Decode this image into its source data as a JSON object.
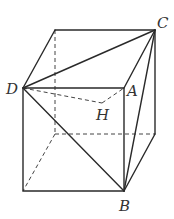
{
  "diagram": {
    "type": "cube-geometry",
    "labels": {
      "C": "C",
      "D": "D",
      "A": "A",
      "H": "H",
      "B": "B"
    },
    "points": {
      "D": [
        23,
        88
      ],
      "A": [
        124,
        88
      ],
      "B": [
        124,
        191
      ],
      "FBL": [
        23,
        191
      ],
      "BTL": [
        55,
        30
      ],
      "C": [
        155,
        30
      ],
      "BBL": [
        55,
        134
      ],
      "BBR": [
        155,
        134
      ],
      "H": [
        102,
        103
      ]
    },
    "solid_edges": [
      [
        "D",
        "A"
      ],
      [
        "A",
        "B"
      ],
      [
        "B",
        "FBL"
      ],
      [
        "FBL",
        "D"
      ],
      [
        "BTL",
        "C"
      ],
      [
        "C",
        "BBR"
      ],
      [
        "D",
        "BTL"
      ],
      [
        "A",
        "C"
      ],
      [
        "B",
        "BBR"
      ],
      [
        "D",
        "C"
      ],
      [
        "D",
        "B"
      ],
      [
        "C",
        "B"
      ]
    ],
    "dashed_edges": [
      [
        "BTL",
        "BBL"
      ],
      [
        "BBL",
        "BBR"
      ],
      [
        "BBL",
        "FBL"
      ],
      [
        "D",
        "H"
      ],
      [
        "H",
        "A"
      ]
    ],
    "colors": {
      "line": "#2a2a2a",
      "label": "#333333",
      "background": "#ffffff"
    }
  }
}
